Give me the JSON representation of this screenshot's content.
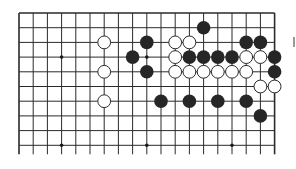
{
  "board": {
    "type": "go-diagram-fragment",
    "columns": 19,
    "rows_visible": 10,
    "origin": {
      "x": 19,
      "y": 13
    },
    "spacing": {
      "x": 14.2,
      "y": 14.7
    },
    "line_extension_bottom": 9,
    "open_bottom": true,
    "colors": {
      "line": "#2a2a2a",
      "black_stone": "#262626",
      "white_stone_fill": "#ffffff",
      "white_stone_stroke": "#2a2a2a",
      "hoshi": "#1a1a1a"
    },
    "hoshi": [
      {
        "col": 3,
        "row": 3
      },
      {
        "col": 9,
        "row": 3
      },
      {
        "col": 3,
        "row": 9
      },
      {
        "col": 9,
        "row": 9
      },
      {
        "col": 15,
        "row": 9
      }
    ],
    "stones": [
      {
        "color": "black",
        "col": 13,
        "row": 1
      },
      {
        "color": "white",
        "col": 6,
        "row": 2
      },
      {
        "color": "black",
        "col": 9,
        "row": 2
      },
      {
        "color": "white",
        "col": 11,
        "row": 2
      },
      {
        "color": "white",
        "col": 12,
        "row": 2
      },
      {
        "color": "black",
        "col": 16,
        "row": 2
      },
      {
        "color": "black",
        "col": 17,
        "row": 2
      },
      {
        "color": "black",
        "col": 8,
        "row": 3
      },
      {
        "color": "white",
        "col": 11,
        "row": 3
      },
      {
        "color": "black",
        "col": 12,
        "row": 3
      },
      {
        "color": "black",
        "col": 13,
        "row": 3
      },
      {
        "color": "black",
        "col": 14,
        "row": 3
      },
      {
        "color": "black",
        "col": 15,
        "row": 3
      },
      {
        "color": "white",
        "col": 16,
        "row": 3
      },
      {
        "color": "white",
        "col": 17,
        "row": 3
      },
      {
        "color": "black",
        "col": 18,
        "row": 3
      },
      {
        "color": "white",
        "col": 6,
        "row": 4
      },
      {
        "color": "black",
        "col": 9,
        "row": 4
      },
      {
        "color": "white",
        "col": 11,
        "row": 4
      },
      {
        "color": "white",
        "col": 12,
        "row": 4
      },
      {
        "color": "white",
        "col": 13,
        "row": 4
      },
      {
        "color": "white",
        "col": 14,
        "row": 4
      },
      {
        "color": "white",
        "col": 15,
        "row": 4
      },
      {
        "color": "white",
        "col": 16,
        "row": 4
      },
      {
        "color": "black",
        "col": 18,
        "row": 4
      },
      {
        "color": "white",
        "col": 17,
        "row": 5
      },
      {
        "color": "white",
        "col": 18,
        "row": 5
      },
      {
        "color": "white",
        "col": 6,
        "row": 6
      },
      {
        "color": "black",
        "col": 10,
        "row": 6
      },
      {
        "color": "black",
        "col": 12,
        "row": 6
      },
      {
        "color": "black",
        "col": 14,
        "row": 6
      },
      {
        "color": "black",
        "col": 16,
        "row": 6
      },
      {
        "color": "black",
        "col": 17,
        "row": 7
      }
    ]
  }
}
